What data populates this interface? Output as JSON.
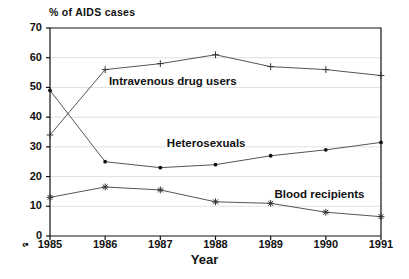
{
  "chart_data": {
    "type": "line",
    "title": "",
    "ylabel": "% of AIDS cases",
    "xlabel": "Year",
    "categories": [
      "1985",
      "1986",
      "1987",
      "1988",
      "1989",
      "1990",
      "1991"
    ],
    "x": [
      1985,
      1986,
      1987,
      1988,
      1989,
      1990,
      1991
    ],
    "ylim": [
      0,
      70
    ],
    "yticks": [
      0,
      10,
      20,
      30,
      40,
      50,
      60,
      70
    ],
    "grid": true,
    "legend_position": "inline-annotations",
    "series": [
      {
        "name": "Intravenous drug users",
        "marker": "plus",
        "values": [
          34,
          56,
          58,
          61,
          57,
          56,
          54
        ],
        "label_x": 1986.05,
        "label_y": 51.5
      },
      {
        "name": "Heterosexuals",
        "marker": "dot",
        "values": [
          49,
          25,
          23,
          24,
          27,
          29,
          31.5
        ],
        "label_x": 1987.1,
        "label_y": 30.5
      },
      {
        "name": "Blood recipients",
        "marker": "asterisk",
        "values": [
          13,
          16.5,
          15.5,
          11.5,
          11,
          8,
          6.5
        ],
        "label_x": 1989.05,
        "label_y": 13.5
      }
    ]
  },
  "axes": {
    "y_title": "% of AIDS cases",
    "x_title": "Year",
    "origin_marker": "‹•"
  },
  "colors": {
    "line": "#555555",
    "axis": "#111111",
    "grid": "#e0e0e0",
    "text": "#111111",
    "background": "#ffffff"
  }
}
